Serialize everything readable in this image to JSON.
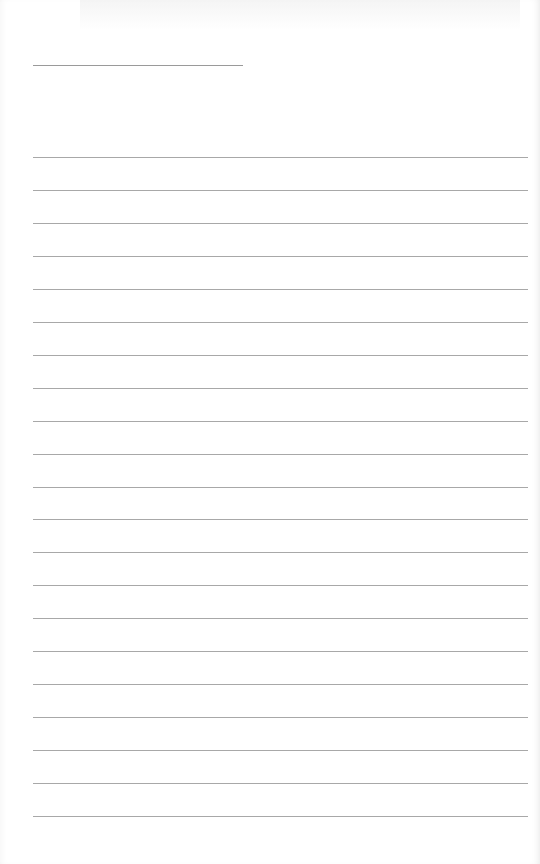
{
  "page": {
    "type": "lined-paper",
    "title": "",
    "title_line": {
      "left": 33,
      "top": 65,
      "width": 210
    },
    "rules": {
      "count": 21,
      "first_top": 157,
      "spacing": 32.95,
      "left": 33,
      "width": 495
    },
    "colors": {
      "paper": "#ffffff",
      "rule": "#a8a8a8",
      "title_rule": "#9a9a9a"
    }
  }
}
